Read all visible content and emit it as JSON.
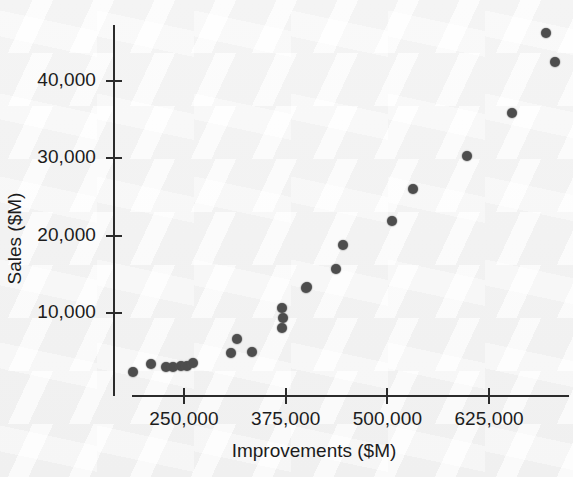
{
  "chart_data": {
    "type": "scatter",
    "title": "",
    "xlabel": "Improvements ($M)",
    "ylabel": "Sales ($M)",
    "xlim": [
      160000,
      730000
    ],
    "ylim": [
      0,
      49000
    ],
    "grid": false,
    "legend": null,
    "marker_color": "#4d4d4d",
    "axis_color": "#2b2b2b",
    "background_color": "#f8f8f8",
    "xticks": [
      {
        "value": 250000,
        "label": "250,000"
      },
      {
        "value": 375000,
        "label": "375,000"
      },
      {
        "value": 500000,
        "label": "500,000"
      },
      {
        "value": 625000,
        "label": "625,000"
      }
    ],
    "yticks": [
      {
        "value": 10000,
        "label": "10,000"
      },
      {
        "value": 20000,
        "label": "20,000"
      },
      {
        "value": 30000,
        "label": "30,000"
      },
      {
        "value": 40000,
        "label": "40,000"
      }
    ],
    "points": [
      {
        "x": 187300,
        "y": 2360
      },
      {
        "x": 209400,
        "y": 3400
      },
      {
        "x": 227900,
        "y": 3000
      },
      {
        "x": 236500,
        "y": 3000
      },
      {
        "x": 246300,
        "y": 3100
      },
      {
        "x": 253700,
        "y": 3100
      },
      {
        "x": 261100,
        "y": 3500
      },
      {
        "x": 307800,
        "y": 4800
      },
      {
        "x": 315200,
        "y": 6700
      },
      {
        "x": 333600,
        "y": 5000
      },
      {
        "x": 370500,
        "y": 8000
      },
      {
        "x": 371700,
        "y": 9300
      },
      {
        "x": 370500,
        "y": 10600
      },
      {
        "x": 400000,
        "y": 13200
      },
      {
        "x": 401200,
        "y": 13400
      },
      {
        "x": 436800,
        "y": 15700
      },
      {
        "x": 445400,
        "y": 18800
      },
      {
        "x": 505600,
        "y": 21900
      },
      {
        "x": 531400,
        "y": 26000
      },
      {
        "x": 597800,
        "y": 30300
      },
      {
        "x": 653100,
        "y": 35900
      },
      {
        "x": 694900,
        "y": 46200
      },
      {
        "x": 706000,
        "y": 42500
      }
    ]
  },
  "axes_geometry": {
    "x_pixel_at_250000": 184,
    "x_pixels_per_unit": 0.0008136,
    "y_pixel_at_10000": 313,
    "y_pixels_per_unit": 0.00773
  }
}
